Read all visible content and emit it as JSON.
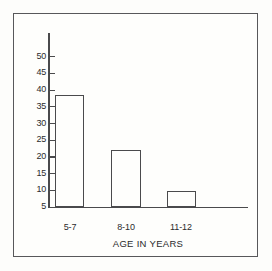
{
  "chart_data": {
    "type": "bar",
    "title": "",
    "subtitle": "",
    "xlabel": "AGE IN YEARS",
    "ylabel": "",
    "categories": [
      "5-7",
      "8-10",
      "11-12"
    ],
    "values": [
      33.5,
      17,
      4.8
    ],
    "series": [
      {
        "name": "",
        "values": [
          33.5,
          17,
          4.8
        ]
      }
    ],
    "ylim": [
      0,
      52
    ],
    "xlim": [
      0,
      6
    ],
    "yticks": [
      5,
      10,
      15,
      20,
      25,
      30,
      35,
      40,
      45,
      50
    ],
    "ytick_labels": [
      "5",
      "10",
      "15",
      "20",
      "25",
      "30",
      "35",
      "40",
      "45",
      "50"
    ],
    "xtick_labels": [
      "5-7",
      "8-10",
      "11-12"
    ],
    "grid": false,
    "legend": null,
    "legend_position": "none",
    "annotations": [],
    "bar_style": {
      "fill": "#fefefc",
      "edge": "#4a4a4c"
    }
  },
  "figure": {
    "background": "#fdfdfb",
    "frame_color": "#58585a",
    "axis_color": "#4a4a4c",
    "text_color": "#2b2b2d"
  }
}
